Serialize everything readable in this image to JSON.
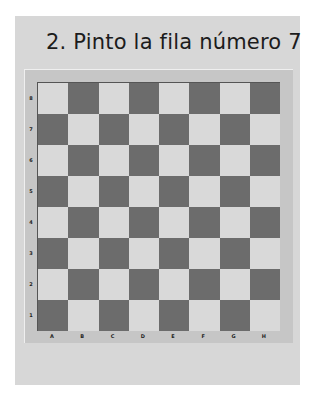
{
  "title": "2. Pinto la fila número 7",
  "board": {
    "ranks": [
      "8",
      "7",
      "6",
      "5",
      "4",
      "3",
      "2",
      "1"
    ],
    "files": [
      "A",
      "B",
      "C",
      "D",
      "E",
      "F",
      "G",
      "H"
    ],
    "colors": {
      "light": "#d9d9d9",
      "dark": "#6c6c6c",
      "frame": "#c6c6c6",
      "panel": "#d7d7d7"
    }
  }
}
